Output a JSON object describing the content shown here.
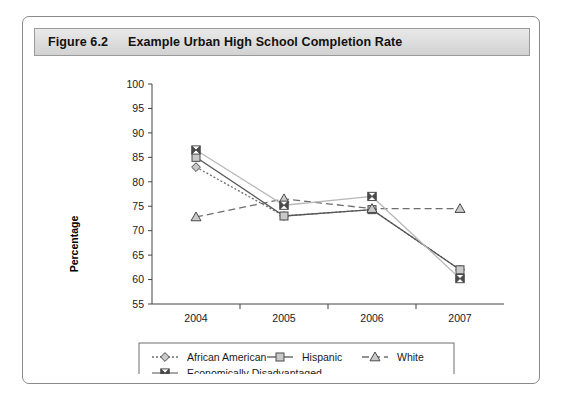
{
  "figure": {
    "number": "Figure 6.2",
    "title": "Example Urban High School Completion Rate"
  },
  "chart_data": {
    "type": "line",
    "title": "Example Urban High School Completion Rate",
    "xlabel": "",
    "ylabel": "Percentage",
    "categories": [
      "2004",
      "2005",
      "2006",
      "2007"
    ],
    "x": [
      2004,
      2005,
      2006,
      2007
    ],
    "ylim": [
      55,
      100
    ],
    "yticks": [
      55,
      60,
      65,
      70,
      75,
      80,
      85,
      90,
      95,
      100
    ],
    "ytick_labels": [
      "55",
      "60",
      "65",
      "70",
      "75",
      "80",
      "85",
      "90",
      "95",
      "100"
    ],
    "xtick_labels": [
      "2004",
      "2005",
      "2006",
      "2007"
    ],
    "grid": false,
    "legend_position": "bottom",
    "series": [
      {
        "name": "African American",
        "marker": "diamond",
        "line_style": "dotted",
        "color": "#6e6e6e",
        "values": [
          83.0,
          73.0,
          74.3,
          62.0
        ]
      },
      {
        "name": "Hispanic",
        "marker": "square",
        "line_style": "solid",
        "color": "#555555",
        "values": [
          85.0,
          73.0,
          74.3,
          62.0
        ]
      },
      {
        "name": "White",
        "marker": "triangle",
        "line_style": "dashed",
        "color": "#6e6e6e",
        "values": [
          72.8,
          76.5,
          74.5,
          74.5
        ]
      },
      {
        "name": "Economically Disadvantaged",
        "marker": "bowtie",
        "line_style": "solid",
        "color": "#b8b8b8",
        "values": [
          86.5,
          75.2,
          77.0,
          60.2
        ]
      }
    ],
    "legend_entries": [
      "African American",
      "Hispanic",
      "White",
      "Economically Disadvantaged"
    ]
  },
  "colors": {
    "frame_border": "#8a8a8a",
    "title_bar_bg": "#dcdcdc",
    "axis": "#444444",
    "text": "#1a1a1a"
  }
}
